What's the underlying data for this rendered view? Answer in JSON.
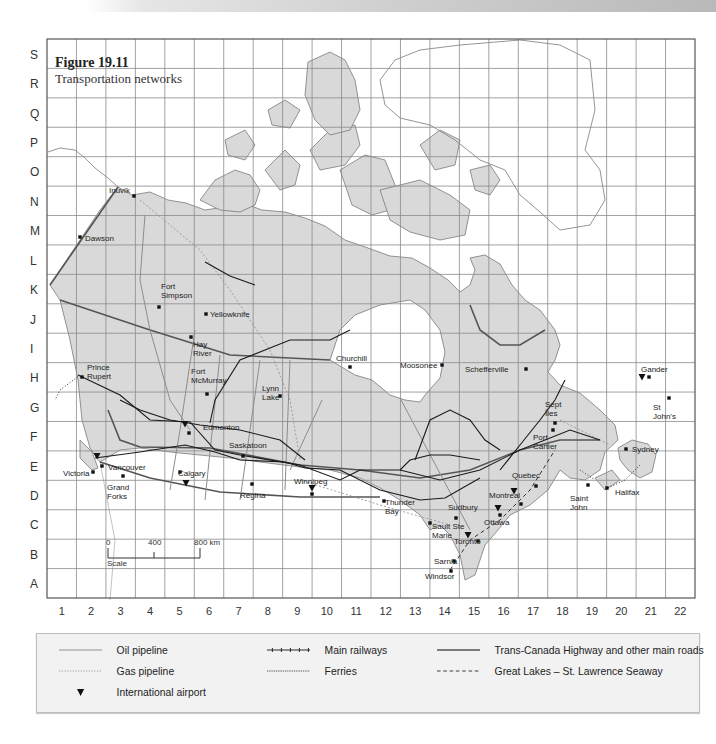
{
  "figure": {
    "title": "Figure 19.11",
    "subtitle": "Transportation networks"
  },
  "grid": {
    "row_labels": [
      "S",
      "R",
      "Q",
      "P",
      "O",
      "N",
      "M",
      "L",
      "K",
      "J",
      "I",
      "H",
      "G",
      "F",
      "E",
      "D",
      "C",
      "B",
      "A"
    ],
    "column_labels": [
      "1",
      "2",
      "3",
      "4",
      "5",
      "6",
      "7",
      "8",
      "9",
      "10",
      "11",
      "12",
      "13",
      "14",
      "15",
      "16",
      "17",
      "18",
      "19",
      "20",
      "21",
      "22"
    ]
  },
  "scale": {
    "label": "Scale",
    "ticks": [
      "0",
      "400",
      "800 km"
    ]
  },
  "cities": [
    {
      "name": "Inuvik",
      "grid": "N4"
    },
    {
      "name": "Dawson",
      "grid": "M2"
    },
    {
      "name": "Fort Simpson",
      "grid": "J5"
    },
    {
      "name": "Yellowknife",
      "grid": "J6"
    },
    {
      "name": "Hay River",
      "grid": "I6"
    },
    {
      "name": "Prince Rupert",
      "grid": "H2"
    },
    {
      "name": "Fort McMurray",
      "grid": "G6"
    },
    {
      "name": "Lynn Lake",
      "grid": "G8"
    },
    {
      "name": "Churchill",
      "grid": "G11"
    },
    {
      "name": "Edmonton",
      "grid": "F5"
    },
    {
      "name": "Saskatoon",
      "grid": "E7"
    },
    {
      "name": "Vancouver",
      "grid": "E2"
    },
    {
      "name": "Victoria",
      "grid": "E2"
    },
    {
      "name": "Grand Forks",
      "grid": "D3"
    },
    {
      "name": "Calgary",
      "grid": "E5"
    },
    {
      "name": "Regina",
      "grid": "D7"
    },
    {
      "name": "Winnipeg",
      "grid": "D9"
    },
    {
      "name": "Thunder Bay",
      "grid": "D12"
    },
    {
      "name": "Moosonee",
      "grid": "E14"
    },
    {
      "name": "Schefferville",
      "grid": "H17"
    },
    {
      "name": "Sept Îles",
      "grid": "F18"
    },
    {
      "name": "Port Cartier",
      "grid": "F18"
    },
    {
      "name": "Gander",
      "grid": "G21"
    },
    {
      "name": "St John's",
      "grid": "G22"
    },
    {
      "name": "Sydney",
      "grid": "E21"
    },
    {
      "name": "Quebec",
      "grid": "D17"
    },
    {
      "name": "Saint John",
      "grid": "D19"
    },
    {
      "name": "Halifax",
      "grid": "D20"
    },
    {
      "name": "Montreal",
      "grid": "D16"
    },
    {
      "name": "Sudbury",
      "grid": "C15"
    },
    {
      "name": "Ottawa",
      "grid": "C16"
    },
    {
      "name": "Sault Ste Marie",
      "grid": "C14"
    },
    {
      "name": "Toronto",
      "grid": "B15"
    },
    {
      "name": "Sarnia",
      "grid": "B15"
    },
    {
      "name": "Windsor",
      "grid": "A15"
    }
  ],
  "airports": [
    "Vancouver",
    "Edmonton",
    "Calgary",
    "Winnipeg",
    "Toronto",
    "Ottawa",
    "Montreal",
    "Gander"
  ],
  "legend": {
    "items": [
      {
        "label": "Oil pipeline",
        "symbol": "oil-pipeline"
      },
      {
        "label": "Gas pipeline",
        "symbol": "gas-pipeline"
      },
      {
        "label": "International airport",
        "symbol": "airport"
      },
      {
        "label": "Main railways",
        "symbol": "railway"
      },
      {
        "label": "Ferries",
        "symbol": "ferry"
      },
      {
        "label": "Trans-Canada Highway and other main roads",
        "symbol": "highway"
      },
      {
        "label": "Great Lakes – St. Lawrence Seaway",
        "symbol": "seaway"
      }
    ]
  },
  "colors": {
    "land": "#d9d9d9",
    "water": "#ffffff",
    "grid": "#8a8a8a",
    "coast": "#6f6f6f",
    "highway": "#555555",
    "railway": "#1a1a1a",
    "legend_bg": "#f2f2f2"
  }
}
